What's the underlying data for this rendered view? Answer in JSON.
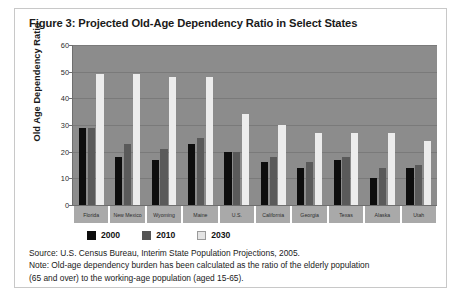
{
  "figure": {
    "title": "Figure 3: Projected Old-Age Dependency Ratio in Select States"
  },
  "legend": {
    "items": [
      {
        "label": "2000",
        "color": "#0d0d0d"
      },
      {
        "label": "2010",
        "color": "#555555"
      },
      {
        "label": "2030",
        "color": "#e4e4e4"
      }
    ]
  },
  "footnotes": {
    "source": "Source: U.S. Census Bureau, Interim State Population Projections, 2005.",
    "note_line1": "Note: Old-age dependency burden has been calculated as the ratio of the elderly population",
    "note_line2": "(65 and over) to the working-age population (aged 15-65)."
  },
  "chart_data": {
    "type": "bar",
    "title": "Figure 3: Projected Old-Age Dependency Ratio in Select States",
    "xlabel": "",
    "ylabel": "Old Age Dependency Ratio",
    "ylim": [
      0,
      60
    ],
    "yticks": [
      0,
      10,
      20,
      30,
      40,
      50,
      60
    ],
    "grid": true,
    "legend_position": "bottom",
    "categories": [
      "Florida",
      "New Mexico",
      "Wyoming",
      "Maine",
      "U.S.",
      "California",
      "Georgia",
      "Texas",
      "Alaska",
      "Utah"
    ],
    "series": [
      {
        "name": "2000",
        "values": [
          29,
          18,
          17,
          23,
          20,
          16,
          14,
          17,
          10,
          14
        ]
      },
      {
        "name": "2010",
        "values": [
          29,
          23,
          21,
          25,
          20,
          18,
          16,
          18,
          14,
          15
        ]
      },
      {
        "name": "2030",
        "values": [
          49,
          49,
          48,
          48,
          34,
          30,
          27,
          27,
          27,
          24
        ]
      }
    ]
  }
}
